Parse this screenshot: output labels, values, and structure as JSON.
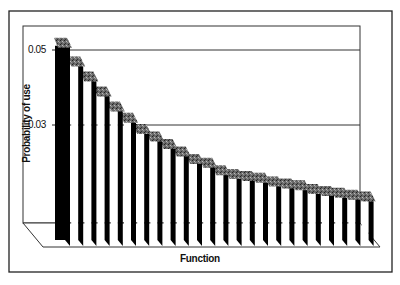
{
  "chart_data": {
    "type": "bar",
    "style": "3d-bar",
    "title": "",
    "xlabel": "Function",
    "ylabel": "Probability of use",
    "yticks": [
      "0.05",
      "0.03"
    ],
    "ytick_values": [
      0.05,
      0.03
    ],
    "grid": true,
    "legend": null,
    "categories": [
      "1",
      "2",
      "3",
      "4",
      "5",
      "6",
      "7",
      "8",
      "9",
      "10",
      "11",
      "12",
      "13",
      "14",
      "15",
      "16",
      "17",
      "18",
      "19",
      "20",
      "21",
      "22",
      "23",
      "24"
    ],
    "values": [
      0.055,
      0.05,
      0.046,
      0.042,
      0.038,
      0.035,
      0.032,
      0.03,
      0.028,
      0.026,
      0.024,
      0.023,
      0.021,
      0.02,
      0.0195,
      0.019,
      0.018,
      0.0175,
      0.017,
      0.016,
      0.0155,
      0.015,
      0.0145,
      0.014
    ],
    "colors": {
      "front": "#ffffff",
      "side": "#000000",
      "top": "#555555",
      "frame": "#222222",
      "grid": "#333333"
    }
  }
}
